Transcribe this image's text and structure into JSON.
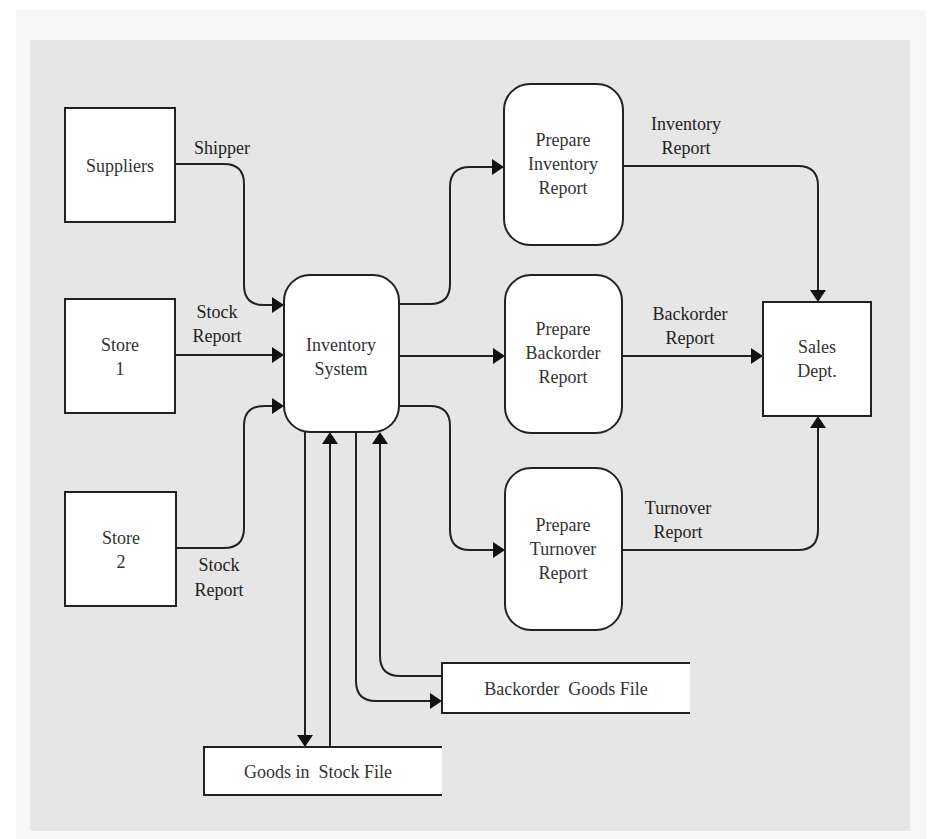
{
  "diagram": {
    "type": "data-flow-diagram",
    "colors": {
      "background": "#ffffff",
      "panel": "#e6e6e6",
      "node_fill": "#ffffff",
      "stroke": "#222222"
    },
    "external_entities": {
      "suppliers": {
        "line1": "Suppliers"
      },
      "store1": {
        "line1": "Store",
        "line2": "1"
      },
      "store2": {
        "line1": "Store",
        "line2": "2"
      },
      "sales": {
        "line1": "Sales",
        "line2": "Dept."
      }
    },
    "processes": {
      "inventory_system": {
        "line1": "Inventory",
        "line2": "System"
      },
      "prepare_inventory": {
        "line1": "Prepare",
        "line2": "Inventory",
        "line3": "Report"
      },
      "prepare_backorder": {
        "line1": "Prepare",
        "line2": "Backorder",
        "line3": "Report"
      },
      "prepare_turnover": {
        "line1": "Prepare",
        "line2": "Turnover",
        "line3": "Report"
      }
    },
    "data_stores": {
      "backorder_goods": {
        "label": "Backorder  Goods File"
      },
      "goods_in_stock": {
        "label": "Goods in  Stock File"
      }
    },
    "flows": {
      "shipper": {
        "line1": "Shipper"
      },
      "stock_report_1": {
        "line1": "Stock",
        "line2": "Report"
      },
      "stock_report_2": {
        "line1": "Stock",
        "line2": "Report"
      },
      "inventory_report": {
        "line1": "Inventory",
        "line2": "Report"
      },
      "backorder_report": {
        "line1": "Backorder",
        "line2": "Report"
      },
      "turnover_report": {
        "line1": "Turnover",
        "line2": "Report"
      }
    }
  }
}
